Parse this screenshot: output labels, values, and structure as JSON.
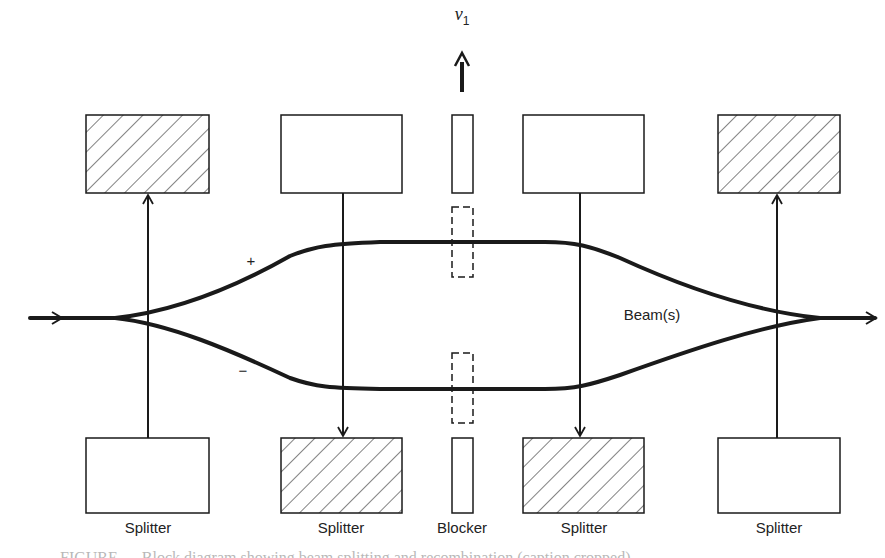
{
  "diagram": {
    "velocity_label": "v",
    "velocity_subscript": "1",
    "plus_sign": "+",
    "minus_sign": "−",
    "beam_label": "Beam(s)",
    "bottom_labels": [
      "Splitter",
      "Splitter",
      "Blocker",
      "Splitter",
      "Splitter"
    ],
    "colors": {
      "line": "#1a1a1a",
      "background": "#ffffff"
    },
    "top_boxes": [
      {
        "x": 86,
        "hatched": true
      },
      {
        "x": 281,
        "hatched": false
      },
      {
        "x": 523,
        "hatched": false
      },
      {
        "x": 718,
        "hatched": true
      }
    ],
    "bottom_boxes": [
      {
        "x": 86,
        "hatched": false
      },
      {
        "x": 281,
        "hatched": true
      },
      {
        "x": 523,
        "hatched": true
      },
      {
        "x": 718,
        "hatched": false
      }
    ],
    "caption_partial": "FIGURE — Block diagram showing beam splitting and recombination (caption cropped)"
  }
}
